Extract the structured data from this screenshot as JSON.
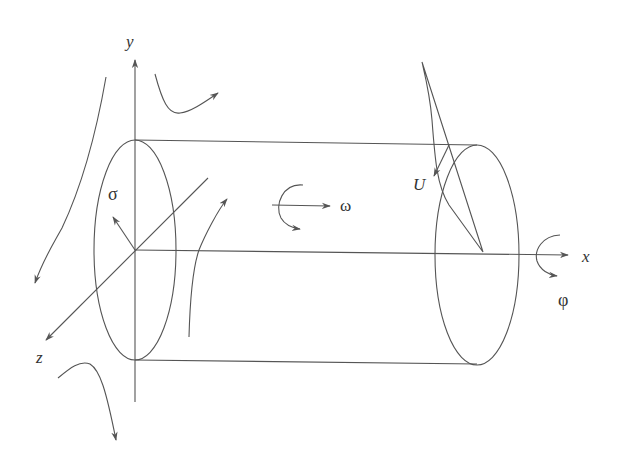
{
  "diagram": {
    "type": "cylinder-in-flow-coordinate-system",
    "labels": {
      "y_axis": "y",
      "x_axis": "x",
      "z_axis": "z",
      "sigma": "σ",
      "omega": "ω",
      "phi": "φ",
      "velocity": "U"
    },
    "colors": {
      "line": "#555555",
      "text": "#333333",
      "background": "#ffffff"
    }
  }
}
